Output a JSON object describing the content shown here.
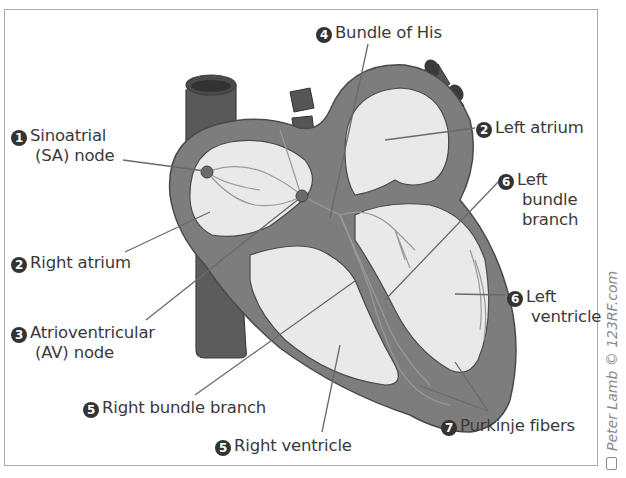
{
  "diagram": {
    "labels": [
      {
        "id": "sa_node",
        "number": "1",
        "lines": [
          "Sinoatrial",
          "(SA) node"
        ]
      },
      {
        "id": "left_atrium",
        "number": "2",
        "lines": [
          "Left atrium"
        ]
      },
      {
        "id": "right_atrium",
        "number": "2",
        "lines": [
          "Right atrium"
        ]
      },
      {
        "id": "av_node",
        "number": "3",
        "lines": [
          "Atrioventricular",
          "(AV) node"
        ]
      },
      {
        "id": "bundle_of_his",
        "number": "4",
        "lines": [
          "Bundle of His"
        ]
      },
      {
        "id": "right_bundle_branch",
        "number": "5",
        "lines": [
          "Right bundle branch"
        ]
      },
      {
        "id": "right_ventricle",
        "number": "5",
        "lines": [
          "Right ventricle"
        ]
      },
      {
        "id": "left_bundle_branch",
        "number": "6",
        "lines": [
          "Left",
          "bundle",
          "branch"
        ]
      },
      {
        "id": "left_ventricle",
        "number": "6",
        "lines": [
          "Left",
          "ventricle"
        ]
      },
      {
        "id": "purkinje_fibers",
        "number": "7",
        "lines": [
          "Purkinje fibers"
        ]
      }
    ],
    "credit": "Peter Lamb © 123RF.com",
    "colors": {
      "wall": "#7d7d7d",
      "wall_dark": "#5f5f5f",
      "vessel": "#595959",
      "chamber": "#e9e9e9",
      "label_text": "#3a3a3a",
      "leader_line": "#6a6a6a",
      "border": "#a9a9a9"
    }
  }
}
